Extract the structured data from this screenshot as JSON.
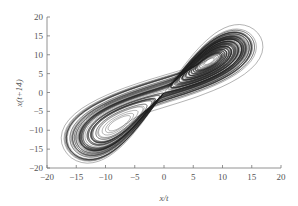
{
  "chart_data": {
    "type": "line",
    "title": "",
    "xlabel": "x/t",
    "ylabel": "x(t+14)",
    "xlim": [
      -20,
      20
    ],
    "ylim": [
      -20,
      20
    ],
    "x_ticks": [
      -20,
      -15,
      -10,
      -5,
      0,
      5,
      10,
      15,
      20
    ],
    "y_ticks": [
      -20,
      -15,
      -10,
      -5,
      0,
      5,
      10,
      15,
      20
    ],
    "grid": false,
    "legend": null,
    "series": [
      {
        "name": "phase-space reconstruction (Lorenz-type attractor)",
        "style": "thin black lines, many overlapping orbits",
        "description": "Butterfly / figure-eight shaped chaotic attractor with two lobes: lower-left lobe centered near (-9, -9) spanning x -16..-1, y -18..-1; upper-right lobe centered near (9, 9) spanning x 1..17, y 1..18; lobes connected through origin along the diagonal",
        "lobe_centers": [
          [
            -9,
            -9
          ],
          [
            9,
            9
          ]
        ],
        "x_range": [
          -16,
          17
        ],
        "y_range": [
          -18,
          18
        ]
      }
    ],
    "colors": {
      "line": "#222222",
      "axis": "#666666",
      "text": "#555555"
    }
  }
}
